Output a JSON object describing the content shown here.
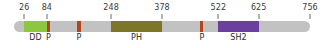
{
  "diagram": {
    "type": "protein-domain-map",
    "sequence_start": 1,
    "sequence_end": 756,
    "backbone_color": "#c2c2c2",
    "background_color": "#ffffff",
    "tick_color": "#6a6a6a",
    "position_labels": [
      {
        "text": "26",
        "position": 26
      },
      {
        "text": "84",
        "position": 84
      },
      {
        "text": "248",
        "position": 248
      },
      {
        "text": "378",
        "position": 378
      },
      {
        "text": "522",
        "position": 522
      },
      {
        "text": "625",
        "position": 625
      },
      {
        "text": "756",
        "position": 756
      }
    ],
    "domains": [
      {
        "label": "DD",
        "start": 26,
        "end": 84,
        "color": "#8fc63f"
      },
      {
        "label": "P",
        "start": 84,
        "end": 92,
        "color": "#b2451c"
      },
      {
        "label": "P",
        "start": 162,
        "end": 170,
        "color": "#b2451c"
      },
      {
        "label": "PH",
        "start": 248,
        "end": 378,
        "color": "#7d7627"
      },
      {
        "label": "P",
        "start": 476,
        "end": 484,
        "color": "#b2451c"
      },
      {
        "label": "SH2",
        "start": 522,
        "end": 625,
        "color": "#6b3fa0"
      }
    ]
  },
  "chart_data": {
    "type": "table",
    "categories": [
      "DD",
      "P",
      "P",
      "PH",
      "P",
      "SH2"
    ],
    "values": [
      58,
      8,
      8,
      130,
      8,
      103
    ],
    "xlabel": "Residue position",
    "ylabel": "",
    "xlim": [
      1,
      756
    ],
    "annotations": [
      "26",
      "84",
      "248",
      "378",
      "522",
      "625",
      "756"
    ]
  }
}
